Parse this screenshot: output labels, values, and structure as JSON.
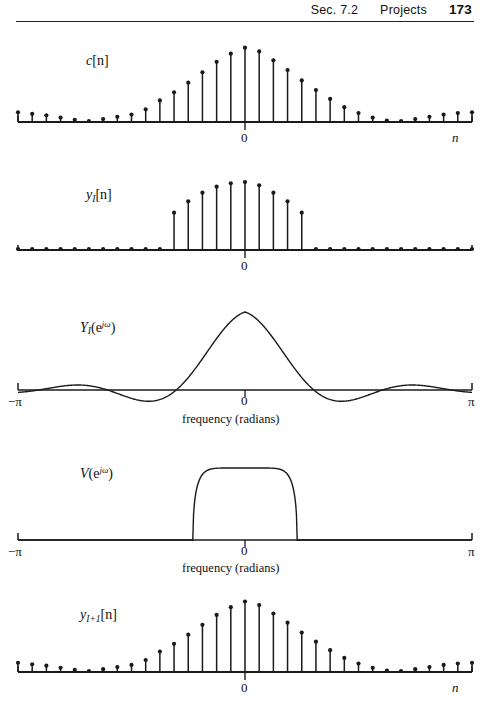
{
  "header": {
    "section": "Sec. 7.2",
    "chapter_title": "Projects",
    "page_number": "173"
  },
  "figure": {
    "panels": [
      {
        "id": "panel-c-n",
        "label_base": "c",
        "label_sub": "",
        "label_tail": "[n]",
        "axis_label": "n",
        "origin_label": "0",
        "caption": ""
      },
      {
        "id": "panel-yI-n",
        "label_base": "y",
        "label_sub": "I",
        "label_tail": "[n]",
        "axis_label": "",
        "origin_label": "0",
        "caption": ""
      },
      {
        "id": "panel-YI-ejw",
        "label_base": "Y",
        "label_sub": "I",
        "label_tail": "(e",
        "axis_left_label": "−π",
        "axis_right_label": "π",
        "origin_label": "0",
        "caption": "frequency  (radians)"
      },
      {
        "id": "panel-V-ejw",
        "label_base": "V",
        "label_sub": "",
        "label_tail": "(e",
        "axis_left_label": "−π",
        "axis_right_label": "π",
        "origin_label": "0",
        "caption": "frequency  (radians)"
      },
      {
        "id": "panel-yI1-n",
        "label_base": "y",
        "label_sub": "I+1",
        "label_tail": "[n]",
        "axis_label": "n",
        "origin_label": "0",
        "caption": ""
      }
    ]
  },
  "chart_data": [
    {
      "type": "stem",
      "name": "c[n]",
      "title": "c[n]",
      "xlabel": "n",
      "ylabel": "",
      "grid": false,
      "legend": "none",
      "x": [
        -16,
        -15,
        -14,
        -13,
        -12,
        -11,
        -10,
        -9,
        -8,
        -7,
        -6,
        -5,
        -4,
        -3,
        -2,
        -1,
        0,
        1,
        2,
        3,
        4,
        5,
        6,
        7,
        8,
        9,
        10,
        11,
        12,
        13,
        14,
        15,
        16
      ],
      "values": [
        0.13,
        0.11,
        0.09,
        0.06,
        0.03,
        0.01,
        0.04,
        0.07,
        0.1,
        0.17,
        0.29,
        0.4,
        0.53,
        0.67,
        0.81,
        0.92,
        1.0,
        0.95,
        0.83,
        0.7,
        0.56,
        0.43,
        0.31,
        0.2,
        0.12,
        0.06,
        0.02,
        0.01,
        0.04,
        0.07,
        0.1,
        0.12,
        0.13
      ],
      "ylim": [
        0,
        1.05
      ]
    },
    {
      "type": "stem",
      "name": "y_I[n]",
      "title": "y_I[n]",
      "xlabel": "",
      "ylabel": "",
      "grid": false,
      "legend": "none",
      "x": [
        -16,
        -15,
        -14,
        -13,
        -12,
        -11,
        -10,
        -9,
        -8,
        -7,
        -6,
        -5,
        -4,
        -3,
        -2,
        -1,
        0,
        1,
        2,
        3,
        4,
        5,
        6,
        7,
        8,
        9,
        10,
        11,
        12,
        13,
        14,
        15,
        16
      ],
      "values": [
        0,
        0,
        0,
        0,
        0,
        0,
        0,
        0,
        0,
        0,
        0,
        0.56,
        0.73,
        0.86,
        0.95,
        1.0,
        1.02,
        0.97,
        0.86,
        0.73,
        0.56,
        0,
        0,
        0,
        0,
        0,
        0,
        0,
        0,
        0,
        0,
        0,
        0
      ],
      "ylim": [
        0,
        1.05
      ]
    },
    {
      "type": "line",
      "name": "Y_I(e^{jw})",
      "title": "Y_I(e^{jw})",
      "xlabel": "frequency  (radians)",
      "ylabel": "",
      "grid": false,
      "legend": "none",
      "xlim": [
        -3.14159,
        3.14159
      ],
      "ylim": [
        -0.18,
        1.05
      ],
      "xticks": [
        "−π",
        "0",
        "π"
      ],
      "description": "sinc-like spectrum: main lobe centered at 0 with peak 1.0, zero crossings near +/-0.95 rad, decaying side lobes of alternating sign with amplitude under 0.12"
    },
    {
      "type": "line",
      "name": "V(e^{jw})",
      "title": "V(e^{jw})",
      "xlabel": "frequency  (radians)",
      "ylabel": "",
      "grid": false,
      "legend": "none",
      "xlim": [
        -3.14159,
        3.14159
      ],
      "ylim": [
        0,
        1.05
      ],
      "xticks": [
        "−π",
        "0",
        "π"
      ],
      "description": "ideal lowpass window: flat-topped dome of height 1.0 with vertical edges at about +/-0.72 rad and rounded shoulders, zero elsewhere"
    },
    {
      "type": "stem",
      "name": "y_{I+1}[n]",
      "title": "y_{I+1}[n]",
      "xlabel": "n",
      "ylabel": "",
      "grid": false,
      "legend": "none",
      "x": [
        -16,
        -15,
        -14,
        -13,
        -12,
        -11,
        -10,
        -9,
        -8,
        -7,
        -6,
        -5,
        -4,
        -3,
        -2,
        -1,
        0,
        1,
        2,
        3,
        4,
        5,
        6,
        7,
        8,
        9,
        10,
        11,
        12,
        13,
        14,
        15,
        16
      ],
      "values": [
        0.13,
        0.11,
        0.09,
        0.06,
        0.03,
        0.01,
        0.04,
        0.07,
        0.1,
        0.17,
        0.29,
        0.4,
        0.53,
        0.67,
        0.81,
        0.92,
        1.0,
        0.95,
        0.83,
        0.7,
        0.56,
        0.43,
        0.31,
        0.2,
        0.12,
        0.06,
        0.02,
        0.01,
        0.04,
        0.07,
        0.1,
        0.12,
        0.13
      ],
      "ylim": [
        0,
        1.05
      ]
    }
  ]
}
